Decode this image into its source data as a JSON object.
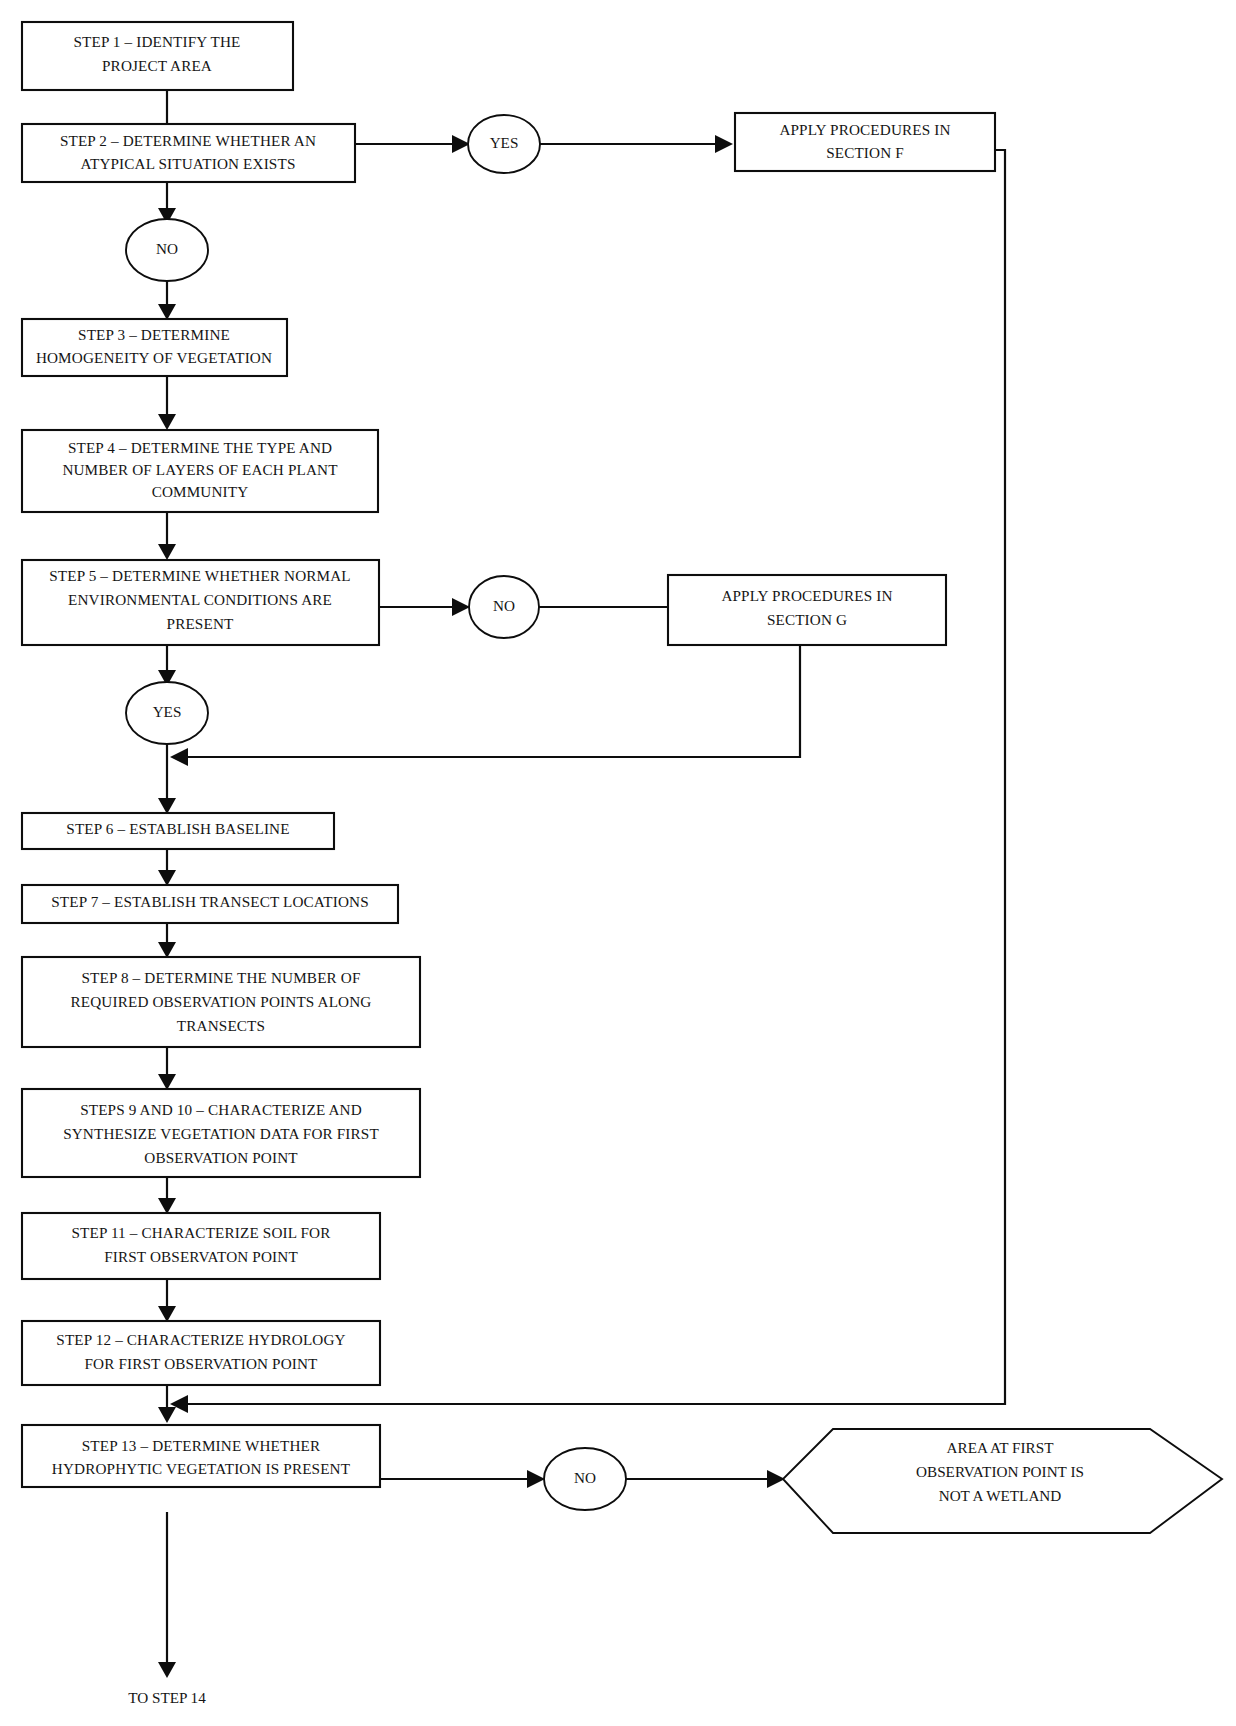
{
  "diagram": {
    "background_color": "#ffffff",
    "line_color": "#0d0d0d",
    "text_color": "#141414"
  },
  "nodes": {
    "step1": {
      "shape": "rectangle",
      "lines": [
        "STEP 1 – IDENTIFY THE",
        "PROJECT AREA"
      ]
    },
    "step2": {
      "shape": "rectangle",
      "lines": [
        "STEP 2 – DETERMINE WHETHER AN",
        "ATYPICAL SITUATION EXISTS"
      ]
    },
    "step2_yes": {
      "shape": "oval",
      "lines": [
        "YES"
      ]
    },
    "step2_no": {
      "shape": "oval",
      "lines": [
        "NO"
      ]
    },
    "section_f": {
      "shape": "rectangle",
      "lines": [
        "APPLY PROCEDURES IN",
        "SECTION F"
      ]
    },
    "step3": {
      "shape": "rectangle",
      "lines": [
        "STEP 3 – DETERMINE",
        "HOMOGENEITY OF VEGETATION"
      ]
    },
    "step4": {
      "shape": "rectangle",
      "lines": [
        "STEP 4 – DETERMINE THE TYPE AND",
        "NUMBER OF LAYERS OF EACH PLANT",
        "COMMUNITY"
      ]
    },
    "step5": {
      "shape": "rectangle",
      "lines": [
        "STEP 5 – DETERMINE WHETHER NORMAL",
        "ENVIRONMENTAL CONDITIONS ARE",
        "PRESENT"
      ]
    },
    "step5_no": {
      "shape": "oval",
      "lines": [
        "NO"
      ]
    },
    "step5_yes": {
      "shape": "oval",
      "lines": [
        "YES"
      ]
    },
    "section_g": {
      "shape": "rectangle",
      "lines": [
        "APPLY PROCEDURES IN",
        "SECTION G"
      ]
    },
    "step6": {
      "shape": "rectangle",
      "lines": [
        "STEP 6 – ESTABLISH BASELINE"
      ]
    },
    "step7": {
      "shape": "rectangle",
      "lines": [
        "STEP 7 – ESTABLISH TRANSECT LOCATIONS"
      ]
    },
    "step8": {
      "shape": "rectangle",
      "lines": [
        "STEP 8 – DETERMINE THE NUMBER OF",
        "REQUIRED OBSERVATION POINTS ALONG",
        "TRANSECTS"
      ]
    },
    "step9_10": {
      "shape": "rectangle",
      "lines": [
        "STEPS 9 AND 10 – CHARACTERIZE AND",
        "SYNTHESIZE VEGETATION DATA FOR FIRST",
        "OBSERVATION POINT"
      ]
    },
    "step11": {
      "shape": "rectangle",
      "lines": [
        "STEP 11 – CHARACTERIZE SOIL FOR",
        "FIRST OBSERVATON POINT"
      ]
    },
    "step12": {
      "shape": "rectangle",
      "lines": [
        "STEP 12 – CHARACTERIZE HYDROLOGY",
        "FOR FIRST OBSERVATION POINT"
      ]
    },
    "step13": {
      "shape": "rectangle",
      "lines": [
        "STEP 13 – DETERMINE WHETHER",
        "HYDROPHYTIC VEGETATION IS PRESENT"
      ]
    },
    "step13_no": {
      "shape": "oval",
      "lines": [
        "NO"
      ]
    },
    "not_wetland": {
      "shape": "hexagon",
      "lines": [
        "AREA AT FIRST",
        "OBSERVATION POINT IS",
        "NOT A WETLAND"
      ]
    },
    "to_step14": {
      "shape": "text",
      "lines": [
        "TO STEP 14"
      ]
    }
  },
  "edges": [
    {
      "from": "step1",
      "to": "step2",
      "label": ""
    },
    {
      "from": "step2",
      "to": "step2_yes",
      "label": "YES"
    },
    {
      "from": "step2_yes",
      "to": "section_f",
      "label": ""
    },
    {
      "from": "step2",
      "to": "step2_no",
      "label": "NO"
    },
    {
      "from": "step2_no",
      "to": "step3",
      "label": ""
    },
    {
      "from": "step3",
      "to": "step4",
      "label": ""
    },
    {
      "from": "step4",
      "to": "step5",
      "label": ""
    },
    {
      "from": "step5",
      "to": "step5_no",
      "label": "NO"
    },
    {
      "from": "step5_no",
      "to": "section_g",
      "label": ""
    },
    {
      "from": "step5",
      "to": "step5_yes",
      "label": "YES"
    },
    {
      "from": "section_g",
      "to": "step6",
      "label": ""
    },
    {
      "from": "step5_yes",
      "to": "step6",
      "label": ""
    },
    {
      "from": "step6",
      "to": "step7",
      "label": ""
    },
    {
      "from": "step7",
      "to": "step8",
      "label": ""
    },
    {
      "from": "step8",
      "to": "step9_10",
      "label": ""
    },
    {
      "from": "step9_10",
      "to": "step11",
      "label": ""
    },
    {
      "from": "step11",
      "to": "step12",
      "label": ""
    },
    {
      "from": "step12",
      "to": "step13",
      "label": ""
    },
    {
      "from": "section_f",
      "to": "step13",
      "label": ""
    },
    {
      "from": "step13",
      "to": "step13_no",
      "label": "NO"
    },
    {
      "from": "step13_no",
      "to": "not_wetland",
      "label": ""
    },
    {
      "from": "step13",
      "to": "to_step14",
      "label": ""
    }
  ]
}
